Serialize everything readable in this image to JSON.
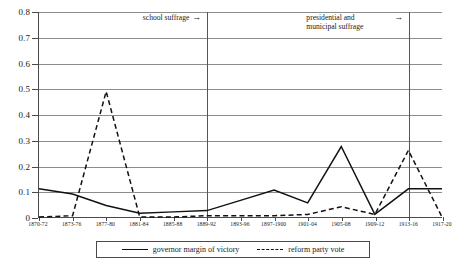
{
  "chart_data": {
    "type": "line",
    "title": "",
    "subtitle": "",
    "xlabel": "",
    "ylabel": "",
    "ylim": [
      0,
      0.8
    ],
    "ytick_step": 0.1,
    "grid": true,
    "legend_position": "bottom",
    "categories": [
      "1870-72",
      "1873-76",
      "1877-80",
      "1881-84",
      "1885-88",
      "1889-92",
      "1893-96",
      "1897-1900",
      "1901-04",
      "1905-08",
      "1909-12",
      "1913-16",
      "1917-20"
    ],
    "yticks": [
      "0",
      "0.1",
      "0.2",
      "0.3",
      "0.4",
      "0.5",
      "0.6",
      "0.7",
      "0.8"
    ],
    "ytick_values": [
      0,
      0.1,
      0.2,
      0.3,
      0.4,
      0.5,
      0.6,
      0.7,
      0.8
    ],
    "series": [
      {
        "name": "governor margin of victory",
        "style": "solid",
        "color": "#111111",
        "values": [
          0.11,
          0.09,
          0.045,
          0.015,
          0.02,
          0.025,
          0.065,
          0.105,
          0.055,
          0.275,
          0.01,
          0.11,
          0.11
        ]
      },
      {
        "name": "reform party vote",
        "style": "dashed",
        "color": "#111111",
        "values": [
          0.0,
          0.005,
          0.49,
          0.0,
          0.0,
          0.005,
          0.005,
          0.005,
          0.01,
          0.04,
          0.01,
          0.26,
          0.0
        ]
      }
    ],
    "annotations": [
      {
        "id": "school-suffrage",
        "text": "school suffrage",
        "arrow": "→",
        "at_category": "1889-92",
        "marker": "vertical-line"
      },
      {
        "id": "presidential-municipal-suffrage",
        "text_line1": "presidential and",
        "text_line2": "municipal suffrage",
        "arrow": "→",
        "at_category": "1913-16",
        "marker": "vertical-line"
      }
    ],
    "legend": [
      {
        "label": "governor margin of victory",
        "style": "solid"
      },
      {
        "label": "reform party vote",
        "style": "dashed"
      }
    ]
  }
}
